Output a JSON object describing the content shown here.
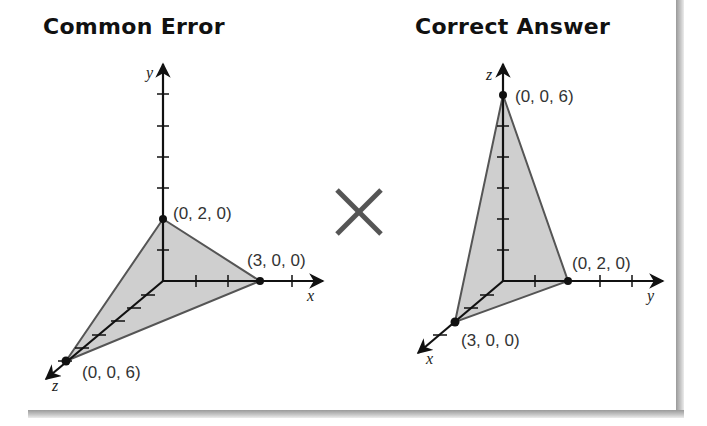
{
  "left_panel": {
    "title": "Common Error",
    "axes": {
      "vertical": "y",
      "horizontal": "x",
      "diagonal": "z"
    },
    "points": [
      {
        "label": "(0, 2, 0)",
        "axis": "y"
      },
      {
        "label": "(3, 0, 0)",
        "axis": "x"
      },
      {
        "label": "(0, 0, 6)",
        "axis": "z"
      }
    ]
  },
  "separator": {
    "icon": "cross-mark",
    "color": "#555555"
  },
  "right_panel": {
    "title": "Correct Answer",
    "axes": {
      "vertical": "z",
      "horizontal": "y",
      "diagonal": "x"
    },
    "points": [
      {
        "label": "(0, 0, 6)",
        "axis": "z"
      },
      {
        "label": "(0, 2, 0)",
        "axis": "y"
      },
      {
        "label": "(3, 0, 0)",
        "axis": "x"
      }
    ]
  },
  "colors": {
    "fill": "#cfcfcf",
    "edge": "#555555",
    "axis": "#111111"
  }
}
